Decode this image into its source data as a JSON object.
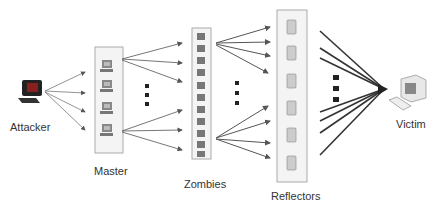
{
  "diagram": {
    "nodes": {
      "attacker": {
        "label": "Attacker",
        "count": 1
      },
      "master": {
        "label": "Master",
        "count": 4
      },
      "zombies": {
        "label": "Zombies",
        "count": 11
      },
      "reflectors": {
        "label": "Reflectors",
        "count": 6
      },
      "victim": {
        "label": "Victim",
        "count": 1
      }
    },
    "edges": [
      {
        "from": "attacker",
        "to": "master"
      },
      {
        "from": "master",
        "to": "zombies"
      },
      {
        "from": "zombies",
        "to": "reflectors"
      },
      {
        "from": "reflectors",
        "to": "victim"
      }
    ],
    "ellipsis": "⋮",
    "colors": {
      "line": "#555555",
      "box_border": "#aaaaaa",
      "box_fill": "#f4f4f4",
      "ellipsis": "#222222"
    }
  }
}
